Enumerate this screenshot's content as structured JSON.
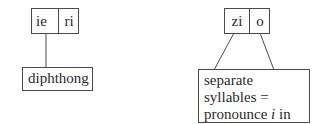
{
  "left": {
    "top_cells": [
      "ie",
      "ri"
    ],
    "bottom_label": "diphthong"
  },
  "right": {
    "top_cells": [
      "zi",
      "o"
    ],
    "bottom_lines": [
      "separate syllables =",
      "pronounce ",
      "i",
      " in its",
      "normal way"
    ]
  },
  "colors": {
    "line": "#4a4a4a",
    "text": "#2a2a2a",
    "background": "#ffffff"
  }
}
